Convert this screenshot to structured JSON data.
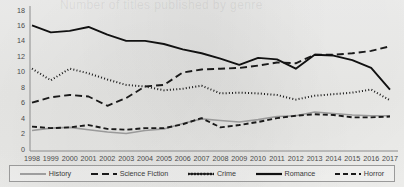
{
  "figure": {
    "background_color": "#efefef",
    "watermark_text": "Number of titles published by genre"
  },
  "axes": {
    "y_ticks": [
      "0",
      "2",
      "4",
      "6",
      "8",
      "10",
      "12",
      "14",
      "16",
      "18"
    ],
    "x_ticks": [
      "1998",
      "1999",
      "2000",
      "2001",
      "2002",
      "2003",
      "2004",
      "2005",
      "2006",
      "2007",
      "2008",
      "2009",
      "2010",
      "2011",
      "2012",
      "2013",
      "2014",
      "2015",
      "2016",
      "2017"
    ]
  },
  "legend": {
    "items": [
      {
        "label": "History",
        "style": "solid-grey",
        "color": "#9a9a9a"
      },
      {
        "label": "Science Fiction",
        "style": "long-dash",
        "color": "#1a1a1a"
      },
      {
        "label": "Crime",
        "style": "dotted",
        "color": "#1a1a1a"
      },
      {
        "label": "Romance",
        "style": "solid",
        "color": "#111111"
      },
      {
        "label": "Horror",
        "style": "dash",
        "color": "#1a1a1a"
      }
    ]
  },
  "chart_data": {
    "type": "line",
    "title": "",
    "subtitle": "",
    "xlabel": "",
    "ylabel": "",
    "xlim": [
      1998,
      2017
    ],
    "ylim": [
      0,
      18
    ],
    "y_tick_step": 2,
    "grid": false,
    "legend_position": "bottom",
    "x": [
      1998,
      1999,
      2000,
      2001,
      2002,
      2003,
      2004,
      2005,
      2006,
      2007,
      2008,
      2009,
      2010,
      2011,
      2012,
      2013,
      2014,
      2015,
      2016,
      2017
    ],
    "series": [
      {
        "name": "History",
        "color": "#9a9a9a",
        "dash": "none",
        "width": 1.6,
        "values": [
          2.4,
          2.7,
          2.8,
          2.5,
          2.2,
          2.0,
          2.4,
          2.6,
          3.3,
          3.9,
          3.7,
          3.5,
          3.8,
          4.2,
          4.3,
          4.8,
          4.6,
          4.4,
          4.3,
          4.3
        ]
      },
      {
        "name": "Science Fiction",
        "color": "#1a1a1a",
        "dash": "7,4",
        "width": 1.9,
        "values": [
          6.0,
          6.7,
          7.0,
          6.8,
          5.6,
          6.6,
          8.1,
          8.3,
          9.9,
          10.3,
          10.4,
          10.5,
          10.8,
          11.2,
          11.1,
          12.2,
          12.2,
          12.4,
          12.7,
          13.3
        ]
      },
      {
        "name": "Crime",
        "color": "#1a1a1a",
        "dash": "1,2.2",
        "width": 2.0,
        "values": [
          10.4,
          8.9,
          10.4,
          9.8,
          9.0,
          8.3,
          8.1,
          7.6,
          7.8,
          8.2,
          7.2,
          7.3,
          7.2,
          7.0,
          6.4,
          6.9,
          7.1,
          7.3,
          7.7,
          6.3
        ]
      },
      {
        "name": "Romance",
        "color": "#111111",
        "dash": "none",
        "width": 1.9,
        "values": [
          16.0,
          15.1,
          15.3,
          15.8,
          14.8,
          14.0,
          14.0,
          13.6,
          12.9,
          12.4,
          11.7,
          10.9,
          11.8,
          11.6,
          10.4,
          12.2,
          12.1,
          11.5,
          10.5,
          7.7
        ]
      },
      {
        "name": "Horror",
        "color": "#1a1a1a",
        "dash": "5,3",
        "width": 1.9,
        "values": [
          2.9,
          2.7,
          2.8,
          3.1,
          2.6,
          2.5,
          2.7,
          2.7,
          3.2,
          4.0,
          2.8,
          3.1,
          3.5,
          4.0,
          4.3,
          4.5,
          4.4,
          4.1,
          4.1,
          4.2
        ]
      }
    ]
  }
}
